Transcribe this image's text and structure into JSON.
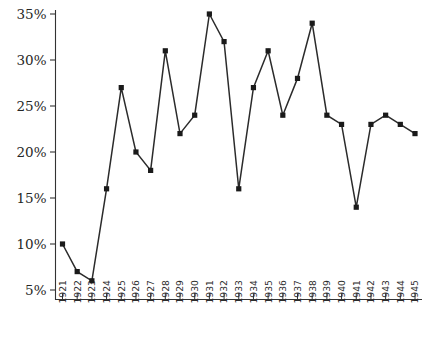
{
  "chart_data": {
    "type": "line",
    "title": "",
    "xlabel": "",
    "ylabel": "",
    "categories": [
      "1921",
      "1922",
      "1923",
      "1924",
      "1925",
      "1926",
      "1927",
      "1928",
      "1929",
      "1930",
      "1931",
      "1932",
      "1933",
      "1934",
      "1935",
      "1936",
      "1937",
      "1938",
      "1939",
      "1940",
      "1941",
      "1942",
      "1943",
      "1944",
      "1945"
    ],
    "values": [
      10,
      7,
      6,
      16,
      27,
      20,
      18,
      31,
      22,
      24,
      35,
      32,
      16,
      27,
      31,
      24,
      28,
      34,
      24,
      23,
      14,
      23,
      24,
      23,
      22
    ],
    "series": [
      {
        "name": "Percentage of Discoveries of Blacks as Black Homicide Victims",
        "values": [
          10,
          7,
          6,
          16,
          27,
          20,
          18,
          31,
          22,
          24,
          35,
          32,
          16,
          27,
          31,
          24,
          28,
          34,
          24,
          23,
          14,
          23,
          24,
          23,
          22
        ]
      }
    ],
    "ytick_labels": [
      "35%",
      "30%",
      "25%",
      "20%",
      "15%",
      "10%",
      "5%"
    ],
    "ytick_values": [
      35,
      30,
      25,
      20,
      15,
      10,
      5
    ],
    "ylim": [
      3,
      36.5
    ],
    "yunit": "%",
    "xlim": [
      "1921",
      "1945"
    ],
    "grid": false,
    "legend": "none",
    "marker": "square",
    "line_color": "#2b2b2b",
    "marker_color": "#1a1a1a"
  },
  "caption": {
    "text": ""
  }
}
